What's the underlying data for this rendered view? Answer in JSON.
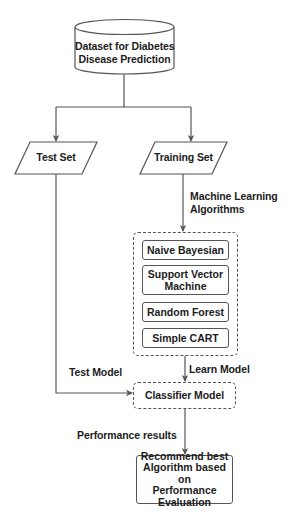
{
  "diagram": {
    "type": "flowchart",
    "colors": {
      "stroke": "#555555",
      "text": "#1c1c1c",
      "background": "#ffffff"
    },
    "nodes": {
      "dataset": {
        "shape": "cylinder",
        "line1": "Dataset for Diabetes",
        "line2": "Disease Prediction"
      },
      "test_set": {
        "shape": "parallelogram",
        "label": "Test Set"
      },
      "training_set": {
        "shape": "parallelogram",
        "label": "Training Set"
      },
      "algorithms_group": {
        "shape": "dashed-rounded-rectangle",
        "items": [
          {
            "label": "Naive Bayesian"
          },
          {
            "line1": "Support Vector",
            "line2": "Machine"
          },
          {
            "label": "Random Forest"
          },
          {
            "label": "Simple CART"
          }
        ]
      },
      "classifier_model": {
        "shape": "dashed-rounded-rectangle",
        "label": "Classifier Model"
      },
      "recommend": {
        "shape": "rounded-rectangle",
        "line1": "Recommend best",
        "line2": "Algorithm based on",
        "line3": "Performance",
        "line4": "Evaluation"
      }
    },
    "edge_labels": {
      "ml_algorithms_line1": "Machine Learning",
      "ml_algorithms_line2": "Algorithms",
      "learn_model": "Learn Model",
      "test_model": "Test Model",
      "performance_results": "Performance results"
    },
    "edges": [
      {
        "from": "dataset",
        "to": "test_set"
      },
      {
        "from": "dataset",
        "to": "training_set"
      },
      {
        "from": "training_set",
        "to": "algorithms_group",
        "label": "Machine Learning Algorithms"
      },
      {
        "from": "algorithms_group",
        "to": "classifier_model",
        "label": "Learn Model"
      },
      {
        "from": "test_set",
        "to": "classifier_model",
        "label": "Test Model"
      },
      {
        "from": "classifier_model",
        "to": "recommend",
        "label": "Performance results"
      }
    ]
  }
}
